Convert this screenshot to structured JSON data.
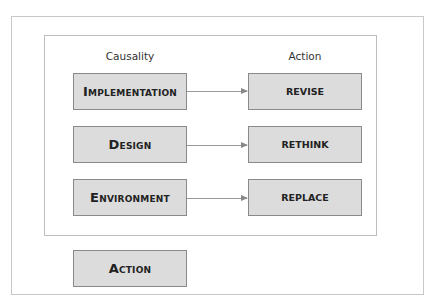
{
  "diagram": {
    "columns": {
      "left": "Causality",
      "right": "Action"
    },
    "rows": [
      {
        "cause": "Implementation",
        "action": "REVISE"
      },
      {
        "cause": "Design",
        "action": "RETHINK"
      },
      {
        "cause": "Environment",
        "action": "REPLACE"
      }
    ],
    "footer_box": "Action",
    "colors": {
      "box_fill": "#dcdcdc",
      "box_border": "#8a8a8a",
      "frame": "#c8c8c8",
      "arrow": "#999999"
    }
  }
}
